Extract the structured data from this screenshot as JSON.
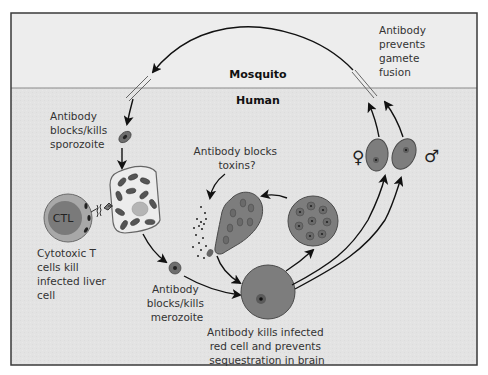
{
  "regions": {
    "mosquito": {
      "label": "Mosquito",
      "color": "#ededed"
    },
    "human": {
      "label": "Human",
      "color": "#e3e3e3"
    }
  },
  "labels": {
    "gamete": [
      "Antibody",
      "prevents",
      "gamete",
      "fusion"
    ],
    "sporozoite": [
      "Antibody",
      "blocks/kills",
      "sporozoite"
    ],
    "toxins": [
      "Antibody blocks",
      "toxins?"
    ],
    "ctl_cell": "CTL",
    "ctl": [
      "Cytotoxic T",
      "cells kill",
      "infected liver",
      "cell"
    ],
    "merozoite": [
      "Antibody",
      "blocks/kills",
      "merozoite"
    ],
    "red_cell": [
      "Antibody kills infected",
      "red cell and prevents",
      "sequestration in brain"
    ]
  },
  "symbols": {
    "female": "♀",
    "male": "♂"
  },
  "stages": [
    "sporozoite",
    "infected liver cell",
    "merozoite",
    "infected red cell",
    "schizont",
    "rupturing schizont",
    "female gametocyte",
    "male gametocyte"
  ],
  "colors": {
    "cell_fill": "#7d7d7d",
    "cell_stroke": "#4a4a4a",
    "nucleus": "#2a2a2a",
    "liver_fill": "#ececec",
    "ctl_outer": "#9a9a9a",
    "ctl_inner": "#7a7a7a",
    "arrow": "#111111",
    "frame": "#3a3a3a"
  }
}
